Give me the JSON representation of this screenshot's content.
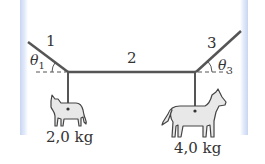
{
  "diagram": {
    "ropes": [
      {
        "label": "1"
      },
      {
        "label": "2"
      },
      {
        "label": "3"
      }
    ],
    "angles": [
      {
        "symbol": "θ",
        "subscript": "1"
      },
      {
        "symbol": "θ",
        "subscript": "3"
      }
    ],
    "masses": [
      {
        "animal": "cat",
        "label": "2,0 kg"
      },
      {
        "animal": "dog",
        "label": "4,0 kg"
      }
    ],
    "colors": {
      "rope": "#555555",
      "wall": "#c9d6f2",
      "animal_fill": "#e6e6e6",
      "animal_stroke": "#444444"
    }
  }
}
